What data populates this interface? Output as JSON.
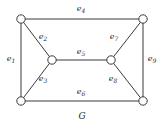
{
  "figure": {
    "caption": "G",
    "stroke_color": "#3a3a3a",
    "label_color": "#2b2b2b",
    "background_color": "#ffffff",
    "vertex_fill": "#ffffff"
  },
  "vertices": [
    {
      "id": "v1",
      "name": "top-left-vertex",
      "x": 21,
      "y": 19
    },
    {
      "id": "v2",
      "name": "top-right-vertex",
      "x": 143,
      "y": 19
    },
    {
      "id": "v3",
      "name": "mid-left-vertex",
      "x": 52,
      "y": 60
    },
    {
      "id": "v4",
      "name": "mid-right-vertex",
      "x": 111,
      "y": 60
    },
    {
      "id": "v5",
      "name": "bottom-left-vertex",
      "x": 21,
      "y": 101
    },
    {
      "id": "v6",
      "name": "bottom-right-vertex",
      "x": 143,
      "y": 101
    }
  ],
  "edges": [
    {
      "id": "e1",
      "label": "e",
      "sub": "1",
      "from": "v1",
      "to": "v5",
      "label_x": 11,
      "label_y": 59
    },
    {
      "id": "e2",
      "label": "e",
      "sub": "2",
      "from": "v1",
      "to": "v3",
      "label_x": 43,
      "label_y": 37
    },
    {
      "id": "e3",
      "label": "e",
      "sub": "3",
      "from": "v3",
      "to": "v5",
      "label_x": 43,
      "label_y": 79
    },
    {
      "id": "e4",
      "label": "e",
      "sub": "4",
      "from": "v1",
      "to": "v2",
      "label_x": 81,
      "label_y": 9
    },
    {
      "id": "e5",
      "label": "e",
      "sub": "5",
      "from": "v3",
      "to": "v4",
      "label_x": 81,
      "label_y": 52
    },
    {
      "id": "e6",
      "label": "e",
      "sub": "6",
      "from": "v5",
      "to": "v6",
      "label_x": 81,
      "label_y": 92
    },
    {
      "id": "e7",
      "label": "e",
      "sub": "7",
      "from": "v2",
      "to": "v4",
      "label_x": 114,
      "label_y": 37
    },
    {
      "id": "e8",
      "label": "e",
      "sub": "8",
      "from": "v4",
      "to": "v6",
      "label_x": 113,
      "label_y": 79
    },
    {
      "id": "e9",
      "label": "e",
      "sub": "9",
      "from": "v2",
      "to": "v6",
      "label_x": 152,
      "label_y": 59
    }
  ]
}
